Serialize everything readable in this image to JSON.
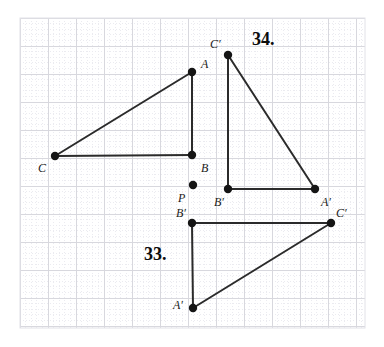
{
  "canvas": {
    "width": 384,
    "height": 347,
    "background_color": "#ffffff",
    "ink_color": "#262626",
    "grid": {
      "x0": 20,
      "y0": 18,
      "x1": 365,
      "y1": 328,
      "major_spacing": 28,
      "minor_per_major": 5,
      "major_color": "#d8d8de",
      "minor_color": "#ebebf0",
      "border_color": "#e2e2e8"
    }
  },
  "problems": [
    {
      "id": "problem-34",
      "label": "34.",
      "x": 252,
      "y": 30
    },
    {
      "id": "problem-33",
      "label": "33.",
      "x": 144,
      "y": 245
    }
  ],
  "figures": [
    {
      "id": "figure-34-preimage",
      "name": "triangle-ABC-preimage",
      "points": [
        {
          "id": "A",
          "label": "A",
          "x": 192,
          "y": 72,
          "lx": 201,
          "ly": 58
        },
        {
          "id": "B",
          "label": "B",
          "x": 192,
          "y": 155,
          "lx": 201,
          "ly": 162
        },
        {
          "id": "C",
          "label": "C",
          "x": 55,
          "y": 156,
          "lx": 38,
          "ly": 162
        }
      ],
      "edges": [
        [
          "A",
          "B"
        ],
        [
          "B",
          "C"
        ],
        [
          "C",
          "A"
        ]
      ]
    },
    {
      "id": "figure-34-image",
      "name": "triangle-ABC-prime-image",
      "points": [
        {
          "id": "Cp",
          "label": "C′",
          "x": 228,
          "y": 55,
          "lx": 210,
          "ly": 38
        },
        {
          "id": "Bp",
          "label": "B′",
          "x": 228,
          "y": 189,
          "lx": 214,
          "ly": 196
        },
        {
          "id": "Ap",
          "label": "A′",
          "x": 315,
          "y": 189,
          "lx": 321,
          "ly": 196
        }
      ],
      "edges": [
        [
          "Cp",
          "Bp"
        ],
        [
          "Bp",
          "Ap"
        ],
        [
          "Ap",
          "Cp"
        ]
      ]
    },
    {
      "id": "figure-33-image",
      "name": "triangle-ABC-prime-lower",
      "points": [
        {
          "id": "Bp2",
          "label": "B′",
          "x": 192,
          "y": 223,
          "lx": 176,
          "ly": 207
        },
        {
          "id": "Cp2",
          "label": "C′",
          "x": 331,
          "y": 223,
          "lx": 336,
          "ly": 207
        },
        {
          "id": "Ap2",
          "label": "A′",
          "x": 193,
          "y": 308,
          "lx": 173,
          "ly": 299
        }
      ],
      "edges": [
        [
          "Bp2",
          "Cp2"
        ],
        [
          "Cp2",
          "Ap2"
        ],
        [
          "Ap2",
          "Bp2"
        ]
      ]
    }
  ],
  "isolated_points": [
    {
      "id": "P",
      "name": "center-of-rotation-P",
      "label": "P",
      "x": 193,
      "y": 185,
      "lx": 178,
      "ly": 192
    }
  ],
  "style": {
    "vertex_radius": 4.2,
    "edge_width": 2.0,
    "edge_color": "#2b2b2b",
    "vertex_color": "#151515"
  }
}
